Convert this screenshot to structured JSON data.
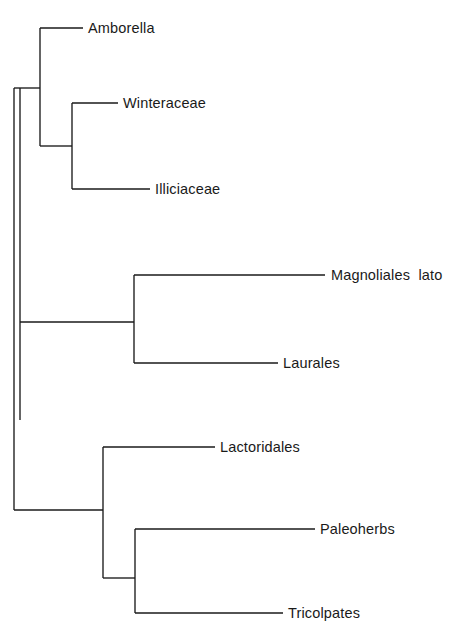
{
  "figure": {
    "type": "cladogram",
    "title": "",
    "background_color": "#ffffff",
    "line_color": "#1a1a1a",
    "width": 457,
    "height": 630
  },
  "chart_data": {
    "type": "tree",
    "title": "",
    "xlabel": "",
    "ylabel": "",
    "orientation": "left-to-right rectangular cladogram",
    "root_x": 14,
    "taxa": [
      {
        "name": "Amborella",
        "tip_y": 28,
        "tip_x": 83,
        "label_x": 88
      },
      {
        "name": "Winteraceae",
        "tip_y": 103,
        "tip_x": 118,
        "label_x": 123
      },
      {
        "name": "Illiciaceae",
        "tip_y": 189,
        "tip_x": 150,
        "label_x": 155
      },
      {
        "name": "Magnoliales  lato",
        "tip_y": 275,
        "tip_x": 325,
        "label_x": 331
      },
      {
        "name": "Laurales",
        "tip_y": 363,
        "tip_x": 278,
        "label_x": 283
      },
      {
        "name": "Lactoridales",
        "tip_y": 447,
        "tip_x": 215,
        "label_x": 220
      },
      {
        "name": "Paleoherbs",
        "tip_y": 529,
        "tip_x": 315,
        "label_x": 320
      },
      {
        "name": "Tricolpates",
        "tip_y": 613,
        "tip_x": 283,
        "label_x": 288
      }
    ],
    "nodes": [
      {
        "id": "root",
        "x": 14,
        "y_top": 88,
        "y_bottom": 510
      },
      {
        "id": "clade-inner",
        "x": 20,
        "y_top": 88,
        "y_bottom": 420
      },
      {
        "id": "amborella-group",
        "x": 40,
        "y_top": 28,
        "y_bottom": 146
      },
      {
        "id": "winter-illici",
        "x": 72,
        "y_top": 103,
        "y_bottom": 189
      },
      {
        "id": "magnol-laurales",
        "x": 134,
        "y_top": 275,
        "y_bottom": 363
      },
      {
        "id": "lactoridales-group",
        "x": 103,
        "y_top": 447,
        "y_bottom": 578
      },
      {
        "id": "paleo-tricolp",
        "x": 135,
        "y_top": 529,
        "y_bottom": 613
      }
    ],
    "connectors": [
      {
        "from_x": 14,
        "to_x": 40,
        "y": 88
      },
      {
        "from_x": 40,
        "to_x": 72,
        "y": 146
      },
      {
        "from_x": 20,
        "to_x": 134,
        "y": 322
      },
      {
        "from_x": 14,
        "to_x": 103,
        "y": 510
      },
      {
        "from_x": 103,
        "to_x": 135,
        "y": 578
      }
    ]
  }
}
